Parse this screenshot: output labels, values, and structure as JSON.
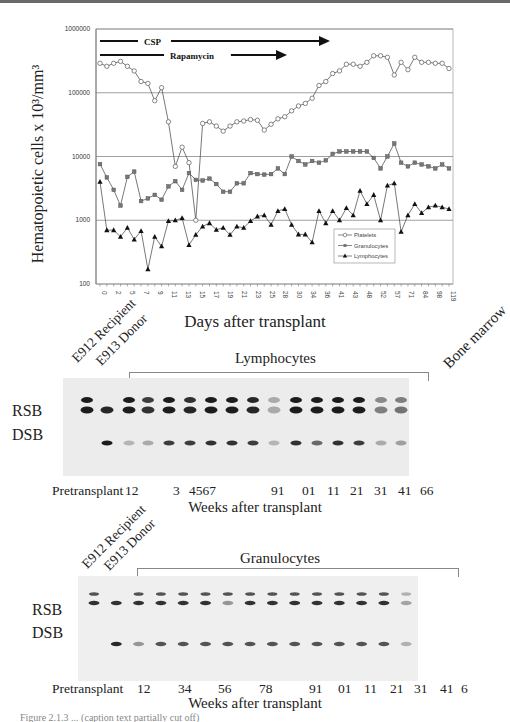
{
  "chart_data": {
    "type": "line",
    "title": "",
    "ylabel": "Hematopoietic cells x 10^3/mm^3",
    "ylabel_text": "Hematopoietic cells x 10³/mm³",
    "xlabel": "Days after transplant",
    "yscale": "log",
    "ylim": [
      100,
      1000000
    ],
    "yticks": [
      "100",
      "1000",
      "10000",
      "100000",
      "1000000"
    ],
    "grid": "horizontal major",
    "legend_position": "lower right inside",
    "xtick_labels": [
      "0",
      "2",
      "5",
      "7",
      "9",
      "11",
      "13",
      "15",
      "17",
      "19",
      "21",
      "23",
      "25",
      "28",
      "30",
      "34",
      "36",
      "41",
      "43",
      "48",
      "52",
      "57",
      "71",
      "84",
      "98",
      "119"
    ],
    "annotations": [
      {
        "label": "CSP",
        "type": "arrow",
        "x_start_index": 0,
        "x_end_index": 28
      },
      {
        "label": "Rapamycin",
        "type": "arrow",
        "x_start_index": 0,
        "x_end_index": 22
      }
    ],
    "n_points": 52,
    "series": [
      {
        "name": "Platelets",
        "marker": "open-circle",
        "values": [
          290000,
          260000,
          290000,
          310000,
          260000,
          220000,
          150000,
          140000,
          75000,
          120000,
          35000,
          7000,
          14000,
          8000,
          1000,
          33000,
          35000,
          30000,
          25000,
          30000,
          35000,
          36000,
          38000,
          37000,
          26000,
          32000,
          39000,
          42000,
          52000,
          62000,
          68000,
          82000,
          130000,
          150000,
          200000,
          220000,
          280000,
          280000,
          260000,
          300000,
          380000,
          380000,
          360000,
          190000,
          300000,
          230000,
          360000,
          300000,
          300000,
          290000,
          290000,
          240000
        ]
      },
      {
        "name": "Granulocytes",
        "marker": "filled-square",
        "values": [
          7600,
          4700,
          3000,
          1700,
          4800,
          5800,
          2000,
          2200,
          2500,
          2100,
          3400,
          4100,
          3000,
          5500,
          4300,
          4200,
          4500,
          3700,
          2800,
          2800,
          3800,
          3800,
          5500,
          5300,
          5200,
          5300,
          6500,
          5300,
          10000,
          8500,
          7500,
          8500,
          8000,
          8700,
          11000,
          12000,
          12000,
          12000,
          12000,
          12000,
          9500,
          6500,
          10000,
          16000,
          8000,
          7000,
          8000,
          7500,
          7000,
          6500,
          7500,
          6500
        ]
      },
      {
        "name": "Lymphocytes",
        "marker": "filled-triangle",
        "values": [
          4000,
          700,
          700,
          550,
          760,
          500,
          680,
          170,
          550,
          390,
          970,
          1000,
          1080,
          410,
          590,
          800,
          900,
          710,
          760,
          590,
          800,
          760,
          970,
          1150,
          1200,
          850,
          1400,
          1500,
          850,
          600,
          600,
          450,
          1400,
          900,
          1400,
          1000,
          1550,
          1200,
          2900,
          1800,
          2500,
          1000,
          3500,
          3800,
          660,
          1200,
          1800,
          1300,
          1600,
          1700,
          1600,
          1500
        ]
      }
    ]
  },
  "figure": {
    "topbar_color": "#6a6a6a",
    "axis_color": "#888888",
    "grid_color": "#888888",
    "line_color": "#555555"
  },
  "gels": [
    {
      "id": "lymphocytes",
      "group_label": "Lymphocytes",
      "lane_headers": [
        "E912 Recipient",
        "E913 Donor"
      ],
      "extra_header": "Bone marrow",
      "band_labels": [
        "RSB",
        "DSB"
      ],
      "week_row_label": "Pretransplant",
      "week_labels": [
        "12",
        "3",
        "4567",
        "91",
        "01",
        "11",
        "21",
        "31",
        "41",
        "66"
      ],
      "axis_label": "Weeks after transplant"
    },
    {
      "id": "granulocytes",
      "group_label": "Granulocytes",
      "lane_headers": [
        "E912 Recipient",
        "E913 Donor"
      ],
      "band_labels": [
        "RSB",
        "DSB"
      ],
      "week_row_label": "Pretransplant",
      "week_labels": [
        "12",
        "34",
        "56",
        "78",
        "91",
        "01",
        "11",
        "21",
        "31",
        "41",
        "6"
      ],
      "axis_label": "Weeks after transplant"
    }
  ],
  "caption_fragment": "Figure 2.1.3 ... (caption text partially cut off)"
}
